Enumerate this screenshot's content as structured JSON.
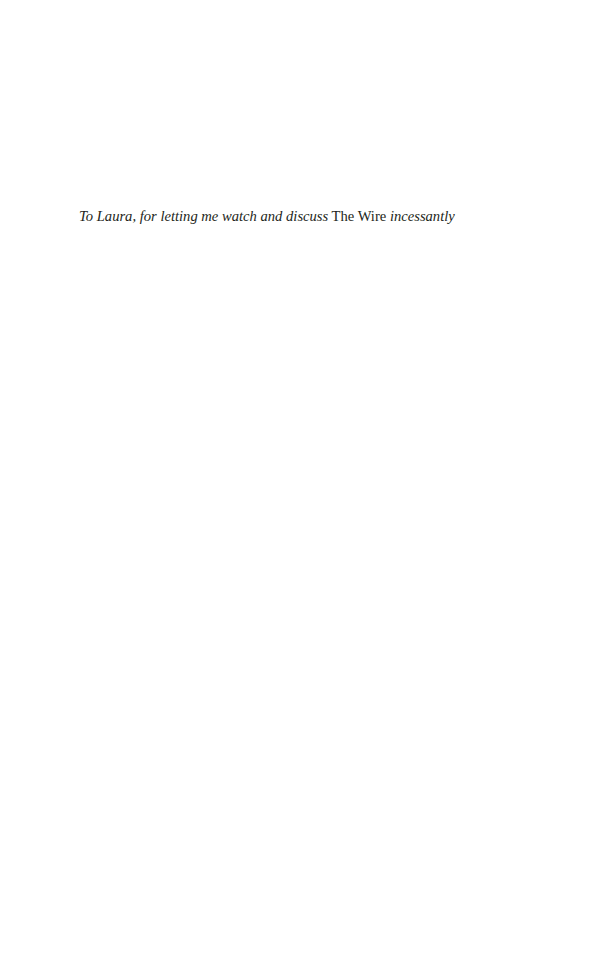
{
  "dedication": {
    "part1": "To Laura, for letting me watch and discuss",
    "title": "The Wire",
    "part2": "incessantly"
  }
}
